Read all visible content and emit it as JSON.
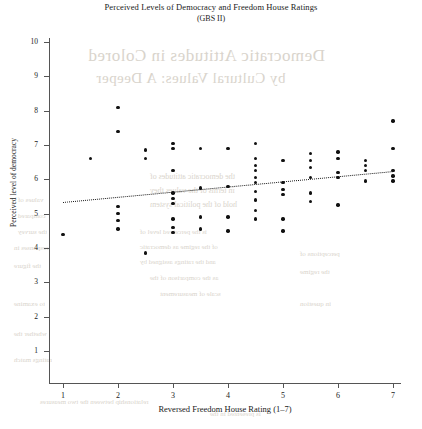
{
  "figure": {
    "title": "Perceived Levels of Democracy and Freedom House Ratings",
    "subtitle": "(GBS II)"
  },
  "chart_data": {
    "type": "scatter",
    "title": "Perceived Levels of Democracy and Freedom House Ratings",
    "subtitle": "(GBS II)",
    "xlabel": "Reversed Freedom House Rating (1–7)",
    "ylabel": "Perceived level of democracy",
    "xlim": [
      0.6,
      7.4
    ],
    "ylim": [
      0.6,
      10.3
    ],
    "xticks": [
      1,
      2,
      3,
      4,
      5,
      6,
      7
    ],
    "xticklabels": [
      "1",
      "2",
      "3",
      "4",
      "5",
      "6",
      "7"
    ],
    "yticks": [
      1,
      2,
      3,
      4,
      5,
      6,
      7,
      8,
      9,
      10
    ],
    "yticklabels": [
      "1",
      "2",
      "3",
      "4",
      "5",
      "6",
      "7",
      "8",
      "9",
      "10"
    ],
    "grid": false,
    "legend": false,
    "marker": "filled-circle",
    "marker_color": "#111111",
    "points": [
      {
        "x": 1.0,
        "y": 4.4
      },
      {
        "x": 1.5,
        "y": 6.6
      },
      {
        "x": 2.0,
        "y": 8.1
      },
      {
        "x": 2.0,
        "y": 7.4
      },
      {
        "x": 2.0,
        "y": 5.2
      },
      {
        "x": 2.0,
        "y": 5.0
      },
      {
        "x": 2.0,
        "y": 4.8
      },
      {
        "x": 2.0,
        "y": 4.55
      },
      {
        "x": 2.5,
        "y": 6.85
      },
      {
        "x": 2.5,
        "y": 6.6
      },
      {
        "x": 2.5,
        "y": 3.85
      },
      {
        "x": 3.0,
        "y": 7.05
      },
      {
        "x": 3.0,
        "y": 6.9
      },
      {
        "x": 3.0,
        "y": 6.25
      },
      {
        "x": 3.0,
        "y": 5.6
      },
      {
        "x": 3.0,
        "y": 5.45
      },
      {
        "x": 3.0,
        "y": 5.3
      },
      {
        "x": 3.0,
        "y": 4.85
      },
      {
        "x": 3.0,
        "y": 4.6
      },
      {
        "x": 3.0,
        "y": 4.45
      },
      {
        "x": 3.5,
        "y": 6.9
      },
      {
        "x": 3.5,
        "y": 5.75
      },
      {
        "x": 3.5,
        "y": 4.9
      },
      {
        "x": 3.5,
        "y": 4.55
      },
      {
        "x": 4.0,
        "y": 6.9
      },
      {
        "x": 4.0,
        "y": 5.8
      },
      {
        "x": 4.0,
        "y": 4.9
      },
      {
        "x": 4.0,
        "y": 4.5
      },
      {
        "x": 4.5,
        "y": 7.05
      },
      {
        "x": 4.5,
        "y": 6.6
      },
      {
        "x": 4.5,
        "y": 6.4
      },
      {
        "x": 4.5,
        "y": 6.25
      },
      {
        "x": 4.5,
        "y": 6.05
      },
      {
        "x": 4.5,
        "y": 5.9
      },
      {
        "x": 4.5,
        "y": 5.65
      },
      {
        "x": 4.5,
        "y": 5.4
      },
      {
        "x": 4.5,
        "y": 5.1
      },
      {
        "x": 4.5,
        "y": 4.85
      },
      {
        "x": 5.0,
        "y": 6.55
      },
      {
        "x": 5.0,
        "y": 5.9
      },
      {
        "x": 5.0,
        "y": 5.7
      },
      {
        "x": 5.0,
        "y": 5.55
      },
      {
        "x": 5.0,
        "y": 4.85
      },
      {
        "x": 5.0,
        "y": 4.5
      },
      {
        "x": 5.5,
        "y": 6.75
      },
      {
        "x": 5.5,
        "y": 6.55
      },
      {
        "x": 5.5,
        "y": 6.35
      },
      {
        "x": 5.5,
        "y": 6.05
      },
      {
        "x": 5.5,
        "y": 5.6
      },
      {
        "x": 5.5,
        "y": 5.35
      },
      {
        "x": 6.0,
        "y": 6.8
      },
      {
        "x": 6.0,
        "y": 6.6
      },
      {
        "x": 6.0,
        "y": 6.2
      },
      {
        "x": 6.0,
        "y": 6.05
      },
      {
        "x": 6.0,
        "y": 5.25
      },
      {
        "x": 6.5,
        "y": 6.55
      },
      {
        "x": 6.5,
        "y": 6.4
      },
      {
        "x": 6.5,
        "y": 6.25
      },
      {
        "x": 6.5,
        "y": 5.95
      },
      {
        "x": 7.0,
        "y": 7.7
      },
      {
        "x": 7.0,
        "y": 6.9
      },
      {
        "x": 7.0,
        "y": 6.25
      },
      {
        "x": 7.0,
        "y": 6.1
      },
      {
        "x": 7.0,
        "y": 5.95
      }
    ],
    "fit_line": {
      "style": "dotted",
      "color": "#1a1a1a",
      "x_start": 1.0,
      "y_start": 5.35,
      "x_end": 7.0,
      "y_end": 6.25
    }
  },
  "bleed_through": {
    "heading1": "Democratic Attitudes in Colored",
    "heading2": "by Cultural Values: A Deeper",
    "body1": "the democratic attitudes of",
    "body2": "in terms of the values they",
    "body3": "hold of the political system",
    "body4": "is the perceived level of",
    "body5": "of the regime as democratic",
    "body6": "and the ratings assigned by",
    "body7": "as the comparison of the",
    "body8": "scale of measurement",
    "left1": "values of",
    "left2": "compared",
    "left3": "the survey",
    "left4": "responses in",
    "left5": "the figure",
    "left6": "to examine",
    "left7": "whether the",
    "left8": "ratings match",
    "right1": "perceptions of",
    "right2": "the regime",
    "right3": "in question",
    "foot1": "relationship between the two measures",
    "foot2": "is presented in the"
  }
}
